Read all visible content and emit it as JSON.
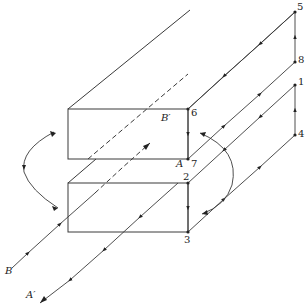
{
  "figure": {
    "colors": {
      "line": "#3a3a3a",
      "text": "#222222",
      "background": "#ffffff"
    }
  },
  "points": {
    "p1": {
      "label": "1",
      "x": 295,
      "y": 85
    },
    "p2": {
      "label": "2",
      "x": 188,
      "y": 183
    },
    "p3": {
      "label": "3",
      "x": 188,
      "y": 232
    },
    "p4": {
      "label": "4",
      "x": 295,
      "y": 135
    },
    "p5": {
      "label": "5",
      "x": 295,
      "y": 12
    },
    "p6": {
      "label": "6",
      "x": 188,
      "y": 109
    },
    "p7": {
      "label": "7",
      "x": 188,
      "y": 159
    },
    "p8": {
      "label": "8",
      "x": 295,
      "y": 62
    }
  },
  "line_labels": {
    "A": "A",
    "A_prime": "A′",
    "B": "B",
    "B_prime": "B′"
  }
}
